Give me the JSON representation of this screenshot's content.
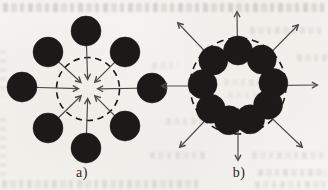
{
  "figure": {
    "caption_labels": {
      "a": "a)",
      "b": "b)"
    },
    "colors": {
      "ink": "#1b1a18",
      "arrow": "#4c4c48",
      "paper": "#f5f3ef"
    }
  },
  "chart_data": {
    "type": "diagram",
    "subfigures": [
      {
        "id": "a",
        "label": "a)",
        "arrows": "inward",
        "center": [
          88,
          89
        ],
        "disc_radius": 15,
        "disc_count": 8,
        "discs": [
          [
            86,
            31
          ],
          [
            125,
            52
          ],
          [
            152,
            88
          ],
          [
            125,
            126
          ],
          [
            86,
            148
          ],
          [
            48,
            128
          ],
          [
            22,
            87
          ],
          [
            48,
            52
          ]
        ],
        "dashed_circle_radius": 31.5,
        "arrow_tip_radius": 10
      },
      {
        "id": "b",
        "label": "b)",
        "arrows": "outward",
        "center": [
          238,
          86
        ],
        "disc_radius": 14.5,
        "disc_count": 9,
        "ring_radius": 35.5,
        "disc_angles_deg": [
          90,
          48,
          5,
          -32,
          -70,
          -105,
          -140,
          177,
          134
        ],
        "dashed_circle_radius": 48,
        "arrow_start_radius": 22,
        "arrow_tips": [
          [
            317,
            85
          ],
          [
            298,
            25
          ],
          [
            237,
            12
          ],
          [
            178,
            23
          ],
          [
            162,
            86
          ],
          [
            180,
            147
          ],
          [
            238,
            160
          ],
          [
            302,
            147
          ]
        ]
      }
    ]
  }
}
